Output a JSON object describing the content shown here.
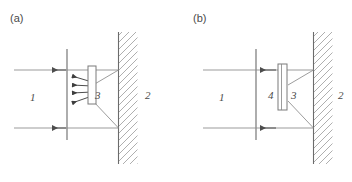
{
  "figure": {
    "background_color": "#ffffff",
    "line_color": "#6b6b6b",
    "hatch_color": "#9b9b9b",
    "text_color": "#4a4a4a",
    "width": 352,
    "height": 182
  },
  "panels": [
    {
      "id": "panel-a",
      "caption": "(a)",
      "caption_x": 10,
      "caption_y": 22,
      "labels": [
        {
          "id": "label-a-1",
          "text": "1",
          "x": 30,
          "y": 101
        },
        {
          "id": "label-a-3",
          "text": "3",
          "x": 95,
          "y": 99
        },
        {
          "id": "label-a-2",
          "text": "2",
          "x": 145,
          "y": 99
        }
      ],
      "aperture_line": {
        "x": 67,
        "y1": 49,
        "y2": 140
      },
      "wall": {
        "line_x": 118,
        "y1": 32,
        "y2": 164,
        "hatch_width": 19,
        "hatch_angle_deg": 45
      },
      "element": {
        "id": "element-3",
        "x": 88,
        "y": 66,
        "width": 8,
        "height": 38,
        "divided": false
      },
      "rays": [
        {
          "id": "ray-top",
          "x1": 118,
          "y1": 70,
          "x2": 67,
          "y2": 70
        },
        {
          "id": "ray-bottom",
          "x1": 118,
          "y1": 128,
          "x2": 67,
          "y2": 128
        },
        {
          "id": "ray-diag-top",
          "x1": 118,
          "y1": 70,
          "x2": 92,
          "y2": 85
        },
        {
          "id": "ray-diag-bottom",
          "x1": 118,
          "y1": 128,
          "x2": 92,
          "y2": 100
        }
      ],
      "outflow_lines": [
        {
          "id": "outflow-top",
          "x1": 67,
          "y1": 70,
          "x2": 14,
          "y2": 70,
          "arrow_at": 48
        },
        {
          "id": "outflow-bottom",
          "x1": 67,
          "y1": 128,
          "x2": 14,
          "y2": 128,
          "arrow_at": 48
        }
      ],
      "small_arrows": [
        {
          "id": "small-arrow-1",
          "x1": 92,
          "y1": 82,
          "x2": 70,
          "y2": 75
        },
        {
          "id": "small-arrow-2",
          "x1": 92,
          "y1": 86,
          "x2": 70,
          "y2": 85
        },
        {
          "id": "small-arrow-3",
          "x1": 92,
          "y1": 92,
          "x2": 70,
          "y2": 93
        },
        {
          "id": "small-arrow-4",
          "x1": 92,
          "y1": 96,
          "x2": 70,
          "y2": 104
        }
      ]
    },
    {
      "id": "panel-b",
      "caption": "(b)",
      "caption_x": 193,
      "caption_y": 22,
      "labels": [
        {
          "id": "label-b-1",
          "text": "1",
          "x": 219,
          "y": 101
        },
        {
          "id": "label-b-4",
          "text": "4",
          "x": 268,
          "y": 99
        },
        {
          "id": "label-b-3",
          "text": "3",
          "x": 291,
          "y": 99
        },
        {
          "id": "label-b-2",
          "text": "2",
          "x": 338,
          "y": 99
        }
      ],
      "aperture_line": {
        "x": 256,
        "y1": 49,
        "y2": 140
      },
      "wall": {
        "line_x": 313,
        "y1": 32,
        "y2": 164,
        "hatch_width": 19,
        "hatch_angle_deg": 45
      },
      "element": {
        "id": "element-3",
        "x": 278,
        "y": 64,
        "width": 9,
        "height": 46,
        "divided": true
      },
      "rays": [
        {
          "id": "ray-top",
          "x1": 313,
          "y1": 70,
          "x2": 256,
          "y2": 70
        },
        {
          "id": "ray-bottom",
          "x1": 313,
          "y1": 128,
          "x2": 256,
          "y2": 128
        },
        {
          "id": "ray-diag-top",
          "x1": 313,
          "y1": 70,
          "x2": 287,
          "y2": 85
        },
        {
          "id": "ray-diag-bottom",
          "x1": 313,
          "y1": 128,
          "x2": 287,
          "y2": 100
        }
      ],
      "outflow_lines": [
        {
          "id": "outflow-top",
          "x1": 256,
          "y1": 70,
          "x2": 203,
          "y2": 70,
          "arrow_at": 258
        },
        {
          "id": "outflow-bottom",
          "x1": 256,
          "y1": 128,
          "x2": 203,
          "y2": 128,
          "arrow_at": 258
        }
      ],
      "small_arrows": []
    }
  ]
}
